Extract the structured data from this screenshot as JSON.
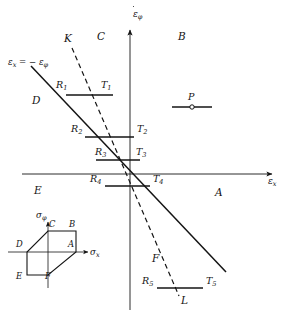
{
  "figure": {
    "type": "strain-rate-plane-diagram",
    "axes": {
      "x_label": "ε",
      "x_sub": "x",
      "x_accent": "dot",
      "y_label": "ε",
      "y_sub": "φ",
      "y_accent": "dot",
      "origin": [
        130,
        174
      ]
    },
    "equation_label": "εₓ = − εᵩ",
    "equation_label_parts": {
      "eps": "ε",
      "sub1": "x",
      "eq": "= −",
      "eps2": "ε",
      "sub2": "φ"
    },
    "lines": [
      {
        "name": "solid-yield-line",
        "style": "solid",
        "from": [
          31,
          66
        ],
        "to": [
          226,
          272
        ]
      },
      {
        "name": "dashed-line-KL",
        "style": "dashed",
        "from": [
          72,
          48
        ],
        "to": [
          179,
          296
        ]
      }
    ],
    "line_end_labels": [
      {
        "name": "K",
        "text": "K",
        "x": 64,
        "y": 38
      },
      {
        "name": "L",
        "text": "L",
        "x": 181,
        "y": 298
      }
    ],
    "regions": [
      {
        "name": "A",
        "text": "A",
        "x": 215,
        "y": 192
      },
      {
        "name": "B",
        "text": "B",
        "x": 178,
        "y": 36
      },
      {
        "name": "C",
        "text": "C",
        "x": 97,
        "y": 36
      },
      {
        "name": "D",
        "text": "D",
        "x": 32,
        "y": 100
      },
      {
        "name": "E",
        "text": "E",
        "x": 34,
        "y": 190
      },
      {
        "name": "F",
        "text": "F",
        "x": 152,
        "y": 258
      }
    ],
    "tie_segments": [
      {
        "id": "T1",
        "left_label": "R",
        "left_sub": "1",
        "right_label": "T",
        "right_sub": "1",
        "x1": 66,
        "x2": 113,
        "y": 95,
        "left_x": 56,
        "left_y": 86,
        "right_x": 101,
        "right_y": 86
      },
      {
        "id": "T2",
        "left_label": "R",
        "left_sub": "2",
        "right_label": "T",
        "right_sub": "2",
        "x1": 85,
        "x2": 134,
        "y": 137,
        "left_x": 73,
        "left_y": 130,
        "right_x": 136,
        "right_y": 130
      },
      {
        "id": "T3",
        "left_label": "R",
        "left_sub": "3",
        "right_label": "T",
        "right_sub": "3",
        "x1": 96,
        "x2": 140,
        "y": 160,
        "left_x": 96,
        "left_y": 152,
        "right_x": 135,
        "right_y": 152
      },
      {
        "id": "T4",
        "left_label": "R",
        "left_sub": "4",
        "right_label": "T",
        "right_sub": "4",
        "x1": 105,
        "x2": 150,
        "y": 186,
        "left_x": 91,
        "left_y": 179,
        "right_x": 152,
        "right_y": 179
      },
      {
        "id": "T5",
        "left_label": "R",
        "left_sub": "5",
        "right_label": "T",
        "right_sub": "5",
        "x1": 157,
        "x2": 203,
        "y": 288,
        "left_x": 143,
        "left_y": 281,
        "right_x": 205,
        "right_y": 281
      }
    ],
    "point_marker": {
      "name": "P",
      "label": "P",
      "x1": 172,
      "x2": 212,
      "y": 107,
      "dot_x": 192,
      "dot_y": 107,
      "label_x": 186,
      "label_y": 96
    },
    "inset": {
      "name": "tresca-hexagon",
      "x_axis_label": "σ",
      "x_axis_sub": "x",
      "y_axis_label": "σ",
      "y_axis_sub": "φ",
      "vertices": [
        {
          "label": "A",
          "x": 76,
          "y": 252
        },
        {
          "label": "B",
          "x": 76,
          "y": 231
        },
        {
          "label": "C",
          "x": 48,
          "y": 231
        },
        {
          "label": "D",
          "x": 27,
          "y": 252
        },
        {
          "label": "E",
          "x": 27,
          "y": 275
        },
        {
          "label": "F",
          "x": 48,
          "y": 275
        }
      ],
      "vertex_labels": [
        {
          "label": "A",
          "x": 70,
          "y": 244
        },
        {
          "label": "B",
          "x": 70,
          "y": 223
        },
        {
          "label": "C",
          "x": 42,
          "y": 223
        },
        {
          "label": "D",
          "x": 15,
          "y": 244
        },
        {
          "label": "E",
          "x": 15,
          "y": 276
        },
        {
          "label": "F",
          "x": 44,
          "y": 276
        }
      ]
    }
  }
}
